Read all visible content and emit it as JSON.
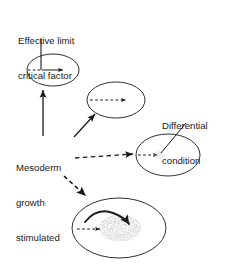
{
  "figure": {
    "domain": "diagram",
    "background_color": "#ffffff",
    "stroke_color": "#1a1a1a",
    "blob_color": "#9a9a9a",
    "width": 227,
    "height": 271
  },
  "labels": {
    "effective_limit": {
      "line1": "Effective limit",
      "line2": "critical factor"
    },
    "mesoderm": {
      "line1": "Mesoderm",
      "line2": "growth",
      "line3": "stimulated"
    },
    "differential": {
      "line1": "Differential",
      "line2": "condition"
    }
  },
  "shapes": {
    "ellipses": [
      {
        "name": "ellipse-effective-limit",
        "cx": 53,
        "cy": 70,
        "rx": 26,
        "ry": 16
      },
      {
        "name": "ellipse-upper-middle",
        "cx": 116,
        "cy": 100,
        "rx": 29,
        "ry": 18
      },
      {
        "name": "ellipse-differential",
        "cx": 168,
        "cy": 155,
        "rx": 32,
        "ry": 21
      },
      {
        "name": "ellipse-bottom",
        "cx": 119,
        "cy": 228,
        "rx": 47,
        "ry": 30
      }
    ],
    "blobs": [
      {
        "name": "blob-differential-condition",
        "cx": 159,
        "cy": 155,
        "rx": 5,
        "ry": 4
      },
      {
        "name": "blob-bottom-growth",
        "cx": 120,
        "cy": 228,
        "rx": 21,
        "ry": 13
      }
    ]
  },
  "connectors": [
    {
      "name": "leader-effective-limit",
      "style": "solid",
      "arrow": false
    },
    {
      "name": "leader-differential-condition",
      "style": "solid",
      "arrow": false
    },
    {
      "name": "arrow-mesoderm-to-effective-limit",
      "style": "solid",
      "arrow": true
    },
    {
      "name": "arrow-mesoderm-to-upper-middle",
      "style": "solid",
      "arrow": true
    },
    {
      "name": "arrow-mesoderm-to-differential",
      "style": "dashed",
      "arrow": true
    },
    {
      "name": "arrow-mesoderm-to-bottom",
      "style": "dashed",
      "arrow": true
    },
    {
      "name": "arrow-inner-effective-limit-dashed",
      "style": "dashed",
      "arrow": false
    },
    {
      "name": "arrow-inner-effective-limit-solid",
      "style": "solid",
      "arrow": true
    },
    {
      "name": "arrow-inner-upper-middle",
      "style": "dashed",
      "arrow": true
    },
    {
      "name": "arrow-inner-differential",
      "style": "dashed",
      "arrow": true
    },
    {
      "name": "arrow-inner-bottom-dashed",
      "style": "dashed",
      "arrow": true
    },
    {
      "name": "arrow-inner-bottom-curved",
      "style": "solid-curved",
      "arrow": true
    }
  ]
}
